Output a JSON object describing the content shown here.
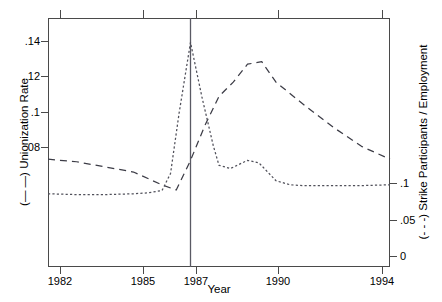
{
  "chart_data": {
    "type": "line",
    "title": "",
    "xlabel": "Year",
    "ylabel_left": "(— —) Unionization Rate",
    "ylabel_right": "(- - -) Strike Participants / Employment",
    "xlim": [
      1982,
      1994
    ],
    "ylim_left": [
      0.0585,
      0.1555
    ],
    "ylim_right": [
      -0.0395,
      0.1135
    ],
    "grid": false,
    "legend": "none",
    "xticks": [
      1982,
      1985,
      1987,
      1990,
      1994
    ],
    "xticklabels": [
      "1982",
      "1985",
      "1987",
      "1990",
      "1994"
    ],
    "yticks_left": [
      0.08,
      0.1,
      0.12,
      0.14
    ],
    "yticklabels_left": [
      ".08",
      ".1",
      ".12",
      ".14"
    ],
    "yticks_right": [
      0,
      0.05,
      0.1
    ],
    "yticklabels_right": [
      "0",
      ".05",
      ".1"
    ],
    "annotations": [
      {
        "type": "vline",
        "x": 1987,
        "label": "1987 reference line"
      }
    ],
    "series": [
      {
        "name": "Unionization Rate",
        "axis": "left",
        "style": "dashed",
        "x": [
          1982,
          1983,
          1984,
          1985,
          1986,
          1986.5,
          1987,
          1987.5,
          1988,
          1988.5,
          1989,
          1989.5,
          1990,
          1991,
          1992,
          1993,
          1994
        ],
        "values": [
          0.1005,
          0.0995,
          0.0975,
          0.0955,
          0.0905,
          0.0885,
          0.1,
          0.1135,
          0.125,
          0.1305,
          0.1375,
          0.1385,
          0.1305,
          0.1215,
          0.113,
          0.1055,
          0.1005
        ]
      },
      {
        "name": "Strike Participants / Employment",
        "axis": "right",
        "style": "dotted",
        "x": [
          1982,
          1983,
          1984,
          1985,
          1985.5,
          1986,
          1986.3,
          1986.6,
          1987,
          1987.4,
          1987.8,
          1988,
          1988.4,
          1989,
          1989.4,
          1990,
          1990.5,
          1991,
          1992,
          1993,
          1994
        ],
        "values": [
          0.0055,
          0.005,
          0.005,
          0.0055,
          0.006,
          0.0075,
          0.018,
          0.055,
          0.0985,
          0.065,
          0.035,
          0.023,
          0.021,
          0.026,
          0.0245,
          0.0135,
          0.011,
          0.0105,
          0.0105,
          0.0105,
          0.011
        ]
      }
    ]
  },
  "axes": {
    "x_title": "Year",
    "y_left_title": "(— —) Unionization Rate",
    "y_right_title": "(- - -) Strike Participants / Employment",
    "x_tick_labels": [
      "1982",
      "1985",
      "1987",
      "1990",
      "1994"
    ],
    "y_left_tick_labels": [
      ".14",
      ".12",
      ".1",
      ".08"
    ],
    "y_right_tick_labels": [
      ".1",
      ".05",
      "0"
    ]
  },
  "colors": {
    "axis": "#4a4a4a",
    "series_union": "#3c3c46",
    "series_strike": "#50505a",
    "vline": "#5a5a64",
    "background": "#ffffff"
  }
}
